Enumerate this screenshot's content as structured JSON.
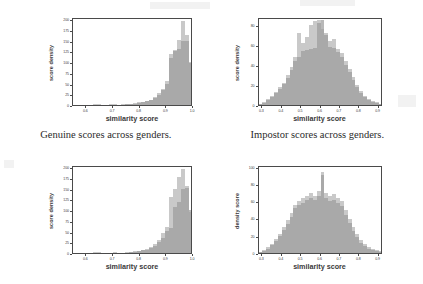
{
  "figure": {
    "background_color": "#ffffff",
    "series_colors": {
      "group_a": "#c9c9c9",
      "group_b": "#9e9e9e",
      "overlap": "#a9a9a9",
      "axis": "#4a4a4a",
      "text": "#3a3a3a"
    },
    "captions": [
      {
        "id": "caption-genuine",
        "text": "Genuine scores across genders."
      },
      {
        "id": "caption-impostor",
        "text": "Impostor scores across genders."
      }
    ]
  },
  "chart_data": [
    {
      "id": "genuine-top",
      "type": "bar",
      "title": "",
      "xlabel": "similarity score",
      "ylabel": "score density",
      "xlim": [
        0.55,
        1.0
      ],
      "ylim": [
        0,
        205
      ],
      "xticks": [
        "0.6",
        "0.7",
        "0.8",
        "0.9",
        "1.0"
      ],
      "xtick_values": [
        0.6,
        0.7,
        0.8,
        0.9,
        1.0
      ],
      "yticks": [
        "0",
        "25",
        "50",
        "75",
        "100",
        "125",
        "150",
        "175",
        "200"
      ],
      "ytick_values": [
        0,
        25,
        50,
        75,
        100,
        125,
        150,
        175,
        200
      ],
      "grid": false,
      "legend": "none",
      "bin_edges": [
        0.55,
        0.565,
        0.58,
        0.595,
        0.61,
        0.625,
        0.64,
        0.655,
        0.67,
        0.685,
        0.7,
        0.715,
        0.73,
        0.745,
        0.76,
        0.775,
        0.79,
        0.805,
        0.82,
        0.835,
        0.85,
        0.865,
        0.88,
        0.895,
        0.91,
        0.925,
        0.94,
        0.955,
        0.97,
        0.985,
        1.0
      ],
      "series": [
        {
          "name": "group A",
          "values": [
            0,
            0,
            0,
            1,
            1,
            2,
            2,
            1,
            1,
            2,
            2,
            1,
            2,
            2,
            3,
            4,
            6,
            8,
            9,
            12,
            18,
            27,
            38,
            55,
            120,
            128,
            152,
            196,
            162,
            100
          ]
        },
        {
          "name": "group B",
          "values": [
            0,
            0,
            0,
            0,
            1,
            1,
            1,
            1,
            1,
            1,
            1,
            1,
            1,
            2,
            2,
            3,
            5,
            7,
            9,
            11,
            16,
            24,
            34,
            50,
            110,
            125,
            131,
            150,
            150,
            98
          ]
        }
      ]
    },
    {
      "id": "impostor-top",
      "type": "bar",
      "title": "",
      "xlabel": "similarity score",
      "ylabel": "score density",
      "xlim": [
        0.28,
        0.92
      ],
      "ylim": [
        0,
        88
      ],
      "xticks": [
        "0.3",
        "0.4",
        "0.5",
        "0.6",
        "0.7",
        "0.8",
        "0.9"
      ],
      "xtick_values": [
        0.3,
        0.4,
        0.5,
        0.6,
        0.7,
        0.8,
        0.9
      ],
      "yticks": [
        "0",
        "20",
        "40",
        "60",
        "80"
      ],
      "ytick_values": [
        0,
        20,
        40,
        60,
        80
      ],
      "grid": false,
      "legend": "none",
      "bin_edges": [
        0.28,
        0.3,
        0.32,
        0.34,
        0.36,
        0.38,
        0.4,
        0.42,
        0.44,
        0.46,
        0.48,
        0.5,
        0.52,
        0.54,
        0.56,
        0.58,
        0.6,
        0.62,
        0.64,
        0.66,
        0.68,
        0.7,
        0.72,
        0.74,
        0.76,
        0.78,
        0.8,
        0.82,
        0.84,
        0.86,
        0.88,
        0.9,
        0.92
      ],
      "series": [
        {
          "name": "group A",
          "values": [
            1,
            3,
            6,
            9,
            13,
            18,
            22,
            30,
            38,
            48,
            72,
            62,
            68,
            80,
            84,
            85,
            76,
            72,
            64,
            66,
            56,
            52,
            44,
            36,
            28,
            20,
            14,
            9,
            6,
            4,
            3,
            1,
            1
          ]
        },
        {
          "name": "group B",
          "values": [
            1,
            2,
            5,
            8,
            12,
            16,
            21,
            27,
            35,
            44,
            48,
            54,
            55,
            56,
            57,
            82,
            85,
            70,
            58,
            57,
            53,
            48,
            40,
            33,
            25,
            18,
            12,
            8,
            5,
            3,
            2,
            1,
            0
          ]
        }
      ]
    },
    {
      "id": "genuine-bottom",
      "type": "bar",
      "title": "",
      "xlabel": "similarity score",
      "ylabel": "score density",
      "xlim": [
        0.55,
        1.0
      ],
      "ylim": [
        0,
        205
      ],
      "xticks": [
        "0.6",
        "0.7",
        "0.8",
        "0.9",
        "1.0"
      ],
      "xtick_values": [
        0.6,
        0.7,
        0.8,
        0.9,
        1.0
      ],
      "yticks": [
        "0",
        "25",
        "50",
        "75",
        "100",
        "125",
        "150",
        "175",
        "200"
      ],
      "ytick_values": [
        0,
        25,
        50,
        75,
        100,
        125,
        150,
        175,
        200
      ],
      "grid": false,
      "legend": "none",
      "bin_edges": [
        0.55,
        0.565,
        0.58,
        0.595,
        0.61,
        0.625,
        0.64,
        0.655,
        0.67,
        0.685,
        0.7,
        0.715,
        0.73,
        0.745,
        0.76,
        0.775,
        0.79,
        0.805,
        0.82,
        0.835,
        0.85,
        0.865,
        0.88,
        0.895,
        0.91,
        0.925,
        0.94,
        0.955,
        0.97,
        0.985,
        1.0
      ],
      "series": [
        {
          "name": "group A",
          "values": [
            0,
            0,
            0,
            1,
            1,
            2,
            2,
            1,
            1,
            1,
            2,
            1,
            1,
            2,
            3,
            4,
            5,
            8,
            10,
            14,
            20,
            30,
            46,
            60,
            130,
            148,
            178,
            196,
            156,
            96
          ]
        },
        {
          "name": "group B",
          "values": [
            0,
            0,
            0,
            0,
            1,
            1,
            1,
            1,
            1,
            1,
            1,
            1,
            1,
            1,
            2,
            3,
            4,
            6,
            8,
            11,
            16,
            25,
            36,
            52,
            58,
            108,
            118,
            150,
            152,
            100
          ]
        }
      ]
    },
    {
      "id": "impostor-bottom",
      "type": "bar",
      "title": "",
      "xlabel": "similarity score",
      "ylabel": "density score",
      "xlim": [
        0.28,
        0.92
      ],
      "ylim": [
        0,
        102
      ],
      "xticks": [
        "0.3",
        "0.4",
        "0.5",
        "0.6",
        "0.7",
        "0.8",
        "0.9"
      ],
      "xtick_values": [
        0.3,
        0.4,
        0.5,
        0.6,
        0.7,
        0.8,
        0.9
      ],
      "yticks": [
        "0",
        "20",
        "40",
        "60",
        "80",
        "100"
      ],
      "ytick_values": [
        0,
        20,
        40,
        60,
        80,
        100
      ],
      "grid": false,
      "legend": "none",
      "bin_edges": [
        0.28,
        0.3,
        0.32,
        0.34,
        0.36,
        0.38,
        0.4,
        0.42,
        0.44,
        0.46,
        0.48,
        0.5,
        0.52,
        0.54,
        0.56,
        0.58,
        0.6,
        0.62,
        0.64,
        0.66,
        0.68,
        0.7,
        0.72,
        0.74,
        0.76,
        0.78,
        0.8,
        0.82,
        0.84,
        0.86,
        0.88,
        0.9,
        0.92
      ],
      "series": [
        {
          "name": "group A",
          "values": [
            1,
            3,
            7,
            10,
            16,
            22,
            30,
            38,
            46,
            56,
            60,
            64,
            66,
            70,
            66,
            72,
            94,
            70,
            66,
            68,
            64,
            60,
            50,
            40,
            30,
            22,
            15,
            10,
            7,
            5,
            3,
            2,
            1
          ]
        },
        {
          "name": "group B",
          "values": [
            1,
            2,
            5,
            9,
            14,
            20,
            27,
            34,
            42,
            52,
            56,
            58,
            62,
            64,
            62,
            66,
            90,
            64,
            60,
            62,
            58,
            54,
            44,
            35,
            26,
            18,
            12,
            8,
            5,
            3,
            2,
            1,
            0
          ]
        }
      ]
    }
  ]
}
